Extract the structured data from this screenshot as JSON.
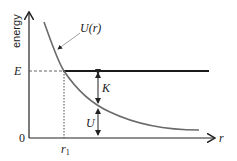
{
  "diagram": {
    "y_axis_label": "energy",
    "x_axis_label": "r",
    "origin_label": "0",
    "energy_level_label": "E",
    "radius_label": "r",
    "radius_subscript": "1",
    "curve_label": "U(r)",
    "kinetic_label": "K",
    "potential_label": "U",
    "colors": {
      "axis": "#222222",
      "curve": "#6a6a6a",
      "energy_line": "#1a1a1a"
    }
  }
}
